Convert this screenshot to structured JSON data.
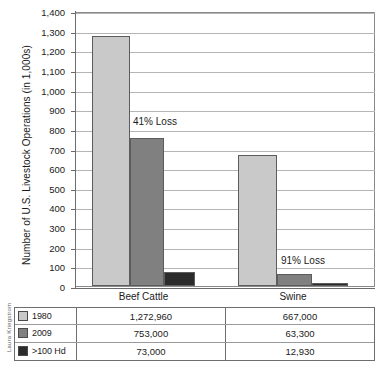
{
  "credit": "Laura Kriegstrom",
  "chart_data": {
    "type": "bar",
    "title": "",
    "xlabel": "",
    "ylabel": "Number of U.S. Livestock Operations (in 1,000s)",
    "ylim": [
      0,
      1400
    ],
    "ytick_step": 100,
    "grid": true,
    "legend_position": "bottom-table",
    "ytick_labels": [
      "1,400",
      "1,300",
      "1,200",
      "1,100",
      "1,000",
      "900",
      "800",
      "700",
      "600",
      "500",
      "400",
      "300",
      "200",
      "100",
      "0"
    ],
    "categories": [
      "Beef Cattle",
      "Swine"
    ],
    "series": [
      {
        "name": "1980",
        "color": "#c9c9c9",
        "values": [
          1272.96,
          667.0
        ],
        "display_values": [
          "1,272,960",
          "667,000"
        ]
      },
      {
        "name": "2009",
        "color": "#808080",
        "values": [
          753.0,
          63.3
        ],
        "display_values": [
          "753,000",
          "63,300"
        ]
      },
      {
        "name": ">100 Hd",
        "color": "#2b2b2b",
        "values": [
          73.0,
          12.93
        ],
        "display_values": [
          "73,000",
          "12,930"
        ]
      }
    ],
    "annotations": [
      {
        "text": "41% Loss",
        "category": "Beef Cattle"
      },
      {
        "text": "91% Loss",
        "category": "Swine"
      }
    ]
  }
}
